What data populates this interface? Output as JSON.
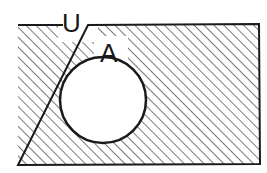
{
  "diagram": {
    "type": "venn",
    "universe_label": "U",
    "set_label": "A",
    "shaded_region": "complement of A (U minus A)",
    "line_color": "#1a1a1a",
    "hatch_color": "#333333",
    "background": "#ffffff"
  }
}
